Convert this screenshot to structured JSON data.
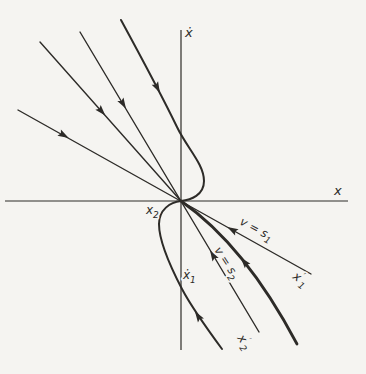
{
  "figure": {
    "width": 366,
    "height": 374,
    "background": "#f5f4f1",
    "ink": "#2d2b28",
    "axes": {
      "vertical": {
        "x": 181,
        "y1": 30,
        "y2": 350,
        "label": "ẋ"
      },
      "horizontal": {
        "y": 201,
        "x1": 5,
        "x2": 348,
        "label": "x"
      }
    },
    "lines": [
      {
        "name": "switching-line-s1",
        "x1": 18,
        "y1": 110,
        "x2": 311,
        "y2": 274,
        "w": 1.4
      },
      {
        "name": "trajectory-line-upper",
        "x1": 40,
        "y1": 42,
        "x2": 181,
        "y2": 201,
        "w": 1.4
      },
      {
        "name": "switching-line-s2",
        "x1": 80,
        "y1": 32,
        "x2": 259,
        "y2": 332,
        "w": 1.4
      }
    ],
    "curves": [
      {
        "name": "trajectory-curve-x2",
        "d": "M121,20 C140,55 162,96 177,127 C187,148 204,164 204,181 C204,195 191,200 181,201 C170,202 159,210 159,224 C159,240 170,266 182,289 C192,308 208,330 222,349",
        "w": 2.0
      },
      {
        "name": "trajectory-thick",
        "d": "M181,201 Q245,245.5 297,344",
        "w": 2.8
      }
    ],
    "arrows": [
      {
        "name": "arrowhead-s1-upper",
        "x": 67,
        "y": 137,
        "angle": 29.3
      },
      {
        "name": "arrowhead-line2-upper",
        "x": 104,
        "y": 114,
        "angle": 48.4
      },
      {
        "name": "arrowhead-s2-upper",
        "x": 125,
        "y": 107,
        "angle": 59.2
      },
      {
        "name": "arrowhead-curve-upper",
        "x": 159,
        "y": 91,
        "angle": 62.7
      },
      {
        "name": "arrowhead-s1-lower",
        "x": 229,
        "y": 228,
        "angle": 209.3
      },
      {
        "name": "arrowhead-thick",
        "x": 242,
        "y": 259,
        "angle": 231.0
      },
      {
        "name": "arrowhead-s2-lower",
        "x": 211,
        "y": 252,
        "angle": 239.2
      },
      {
        "name": "arrowhead-curve-tail",
        "x": 196,
        "y": 313,
        "angle": 236.5
      }
    ],
    "labels": [
      {
        "name": "xdot-axis-label",
        "x": 185,
        "y": 37,
        "size": 13,
        "rotate": 0,
        "halo": false,
        "parts": [
          {
            "t": "ẋ"
          }
        ]
      },
      {
        "name": "x-axis-label",
        "x": 334,
        "y": 195,
        "size": 13,
        "rotate": 0,
        "halo": false,
        "parts": [
          {
            "t": "x"
          }
        ]
      },
      {
        "name": "x2-label",
        "x": 146,
        "y": 214,
        "size": 12,
        "rotate": 0,
        "halo": true,
        "parts": [
          {
            "t": "x"
          },
          {
            "t": "2",
            "shift": "sub"
          }
        ]
      },
      {
        "name": "xdot1-label",
        "x": 183,
        "y": 279,
        "size": 12,
        "rotate": 0,
        "halo": true,
        "parts": [
          {
            "t": "ẋ"
          },
          {
            "t": "1",
            "shift": "sub"
          }
        ]
      },
      {
        "name": "v-s1-label",
        "x": 239,
        "y": 224,
        "size": 11.5,
        "rotate": 28,
        "halo": true,
        "parts": [
          {
            "t": "v = s"
          },
          {
            "t": "1",
            "shift": "sub"
          }
        ]
      },
      {
        "name": "v-s2-label",
        "x": 214,
        "y": 250,
        "size": 11.5,
        "rotate": 57,
        "halo": true,
        "parts": [
          {
            "t": "v = s"
          },
          {
            "t": "2",
            "shift": "sub"
          }
        ]
      },
      {
        "name": "x1-prime-label",
        "x": 292,
        "y": 278,
        "size": 12,
        "rotate": 35,
        "halo": true,
        "parts": [
          {
            "t": "x"
          },
          {
            "t": "′",
            "shift": "sup"
          },
          {
            "t": "1",
            "shift": "sub"
          }
        ]
      },
      {
        "name": "x2-prime-label",
        "x": 237,
        "y": 338,
        "size": 12,
        "rotate": 55,
        "halo": true,
        "parts": [
          {
            "t": "x"
          },
          {
            "t": "′",
            "shift": "sup"
          },
          {
            "t": "2",
            "shift": "sub"
          }
        ]
      }
    ]
  }
}
